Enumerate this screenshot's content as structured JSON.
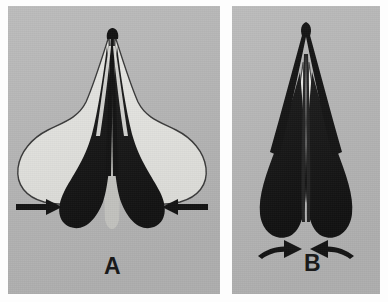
{
  "figure": {
    "kind": "grayscale-micrograph-figure",
    "panel_count": 2,
    "background_color": "#b4b4b4",
    "border_color": "#fdfdfd",
    "ink_color": "#1a1a1a",
    "pale_color": "#e3e3e0",
    "mid_color": "#c9c9c6"
  },
  "panels": [
    {
      "id": "a",
      "label": "A",
      "state_caption": "A",
      "structure": {
        "dark_lobes": 2,
        "pale_wings": 2,
        "apex_stems": 2,
        "configuration": "splayed-open"
      },
      "arrows": [
        {
          "id": "a-left",
          "label": "",
          "style": "straight",
          "direction": "right",
          "color": "#141414"
        },
        {
          "id": "a-right",
          "label": "",
          "style": "straight",
          "direction": "left",
          "color": "#141414"
        }
      ]
    },
    {
      "id": "b",
      "label": "B",
      "state_caption": "B",
      "structure": {
        "dark_lobes": 2,
        "pale_wings": 2,
        "apex_stems": 2,
        "configuration": "closed-narrow"
      },
      "arrows": [
        {
          "id": "b-left",
          "label": "",
          "style": "curved",
          "direction": "right-up",
          "color": "#141414"
        },
        {
          "id": "b-right",
          "label": "",
          "style": "curved",
          "direction": "left-up",
          "color": "#141414"
        }
      ]
    }
  ]
}
